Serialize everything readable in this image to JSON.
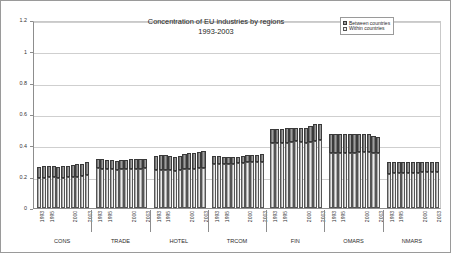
{
  "chart_data": {
    "type": "bar",
    "subtype": "stacked",
    "title": "Concentration of EU industries by regions",
    "subtitle": "1993-2003",
    "xlabel": "",
    "ylabel": "",
    "ylim": [
      0,
      1.2
    ],
    "ytick_labels": [
      "0",
      "0.2",
      "0.4",
      "0.6",
      "0.8",
      "1",
      "1.2"
    ],
    "ytick_values": [
      0,
      0.2,
      0.4,
      0.6,
      0.8,
      1,
      1.2
    ],
    "grid": true,
    "legend_position": "top-right",
    "legend": [
      "Between countries",
      "Within countries"
    ],
    "x": [
      "1993",
      "1994",
      "1995",
      "1996",
      "1997",
      "1998",
      "1999",
      "2000",
      "2001",
      "2002",
      "2003"
    ],
    "x_tick_labels_shown": [
      "1993",
      "1995",
      "2000",
      "2003"
    ],
    "groups": [
      {
        "name": "CONS",
        "years": [
          "1993",
          "1994",
          "1995",
          "1996",
          "1997",
          "1998",
          "1999",
          "2000",
          "2001",
          "2002",
          "2003"
        ],
        "within": [
          0.192,
          0.193,
          0.195,
          0.196,
          0.192,
          0.193,
          0.196,
          0.198,
          0.2,
          0.203,
          0.208
        ],
        "between": [
          0.073,
          0.075,
          0.073,
          0.074,
          0.07,
          0.073,
          0.075,
          0.077,
          0.079,
          0.08,
          0.083
        ],
        "total": [
          0.265,
          0.268,
          0.268,
          0.27,
          0.262,
          0.266,
          0.271,
          0.275,
          0.279,
          0.283,
          0.291
        ]
      },
      {
        "name": "TRADE",
        "years": [
          "1993",
          "1994",
          "1995",
          "1996",
          "1997",
          "1998",
          "1999",
          "2000",
          "2001",
          "2002",
          "2003"
        ],
        "within": [
          0.253,
          0.25,
          0.247,
          0.246,
          0.245,
          0.246,
          0.249,
          0.251,
          0.252,
          0.252,
          0.253
        ],
        "between": [
          0.06,
          0.06,
          0.059,
          0.058,
          0.057,
          0.058,
          0.059,
          0.061,
          0.061,
          0.062,
          0.062
        ],
        "total": [
          0.313,
          0.31,
          0.306,
          0.304,
          0.302,
          0.304,
          0.308,
          0.312,
          0.313,
          0.314,
          0.315
        ]
      },
      {
        "name": "HOTEL",
        "years": [
          "1993",
          "1994",
          "1995",
          "1996",
          "1997",
          "1998",
          "1999",
          "2000",
          "2001",
          "2002",
          "2003"
        ],
        "within": [
          0.243,
          0.244,
          0.243,
          0.242,
          0.238,
          0.243,
          0.248,
          0.251,
          0.251,
          0.253,
          0.256
        ],
        "between": [
          0.092,
          0.093,
          0.093,
          0.09,
          0.087,
          0.09,
          0.095,
          0.1,
          0.103,
          0.105,
          0.108
        ],
        "total": [
          0.335,
          0.337,
          0.336,
          0.332,
          0.325,
          0.333,
          0.343,
          0.351,
          0.354,
          0.358,
          0.364
        ]
      },
      {
        "name": "TRCOM",
        "years": [
          "1993",
          "1994",
          "1995",
          "1996",
          "1997",
          "1998",
          "1999",
          "2000",
          "2001",
          "2002",
          "2003"
        ],
        "within": [
          0.281,
          0.282,
          0.281,
          0.28,
          0.281,
          0.286,
          0.29,
          0.292,
          0.292,
          0.292,
          0.295
        ],
        "between": [
          0.049,
          0.048,
          0.046,
          0.043,
          0.042,
          0.042,
          0.044,
          0.045,
          0.046,
          0.048,
          0.05
        ],
        "total": [
          0.33,
          0.33,
          0.327,
          0.323,
          0.323,
          0.328,
          0.334,
          0.337,
          0.338,
          0.34,
          0.345
        ]
      },
      {
        "name": "FIN",
        "years": [
          "1993",
          "1994",
          "1995",
          "1996",
          "1997",
          "1998",
          "1999",
          "2000",
          "2001",
          "2002",
          "2003"
        ],
        "within": [
          0.417,
          0.416,
          0.416,
          0.418,
          0.422,
          0.426,
          0.42,
          0.415,
          0.421,
          0.428,
          0.431
        ],
        "between": [
          0.086,
          0.088,
          0.09,
          0.092,
          0.09,
          0.087,
          0.089,
          0.096,
          0.105,
          0.109,
          0.104
        ],
        "total": [
          0.503,
          0.504,
          0.506,
          0.51,
          0.512,
          0.513,
          0.509,
          0.511,
          0.526,
          0.537,
          0.535
        ]
      },
      {
        "name": "OMARS",
        "years": [
          "1993",
          "1994",
          "1995",
          "1996",
          "1997",
          "1998",
          "1999",
          "2000",
          "2001",
          "2002",
          "2003"
        ],
        "within": [
          0.352,
          0.352,
          0.35,
          0.348,
          0.35,
          0.352,
          0.355,
          0.357,
          0.355,
          0.352,
          0.348
        ],
        "between": [
          0.12,
          0.12,
          0.121,
          0.122,
          0.12,
          0.119,
          0.117,
          0.116,
          0.115,
          0.11,
          0.104
        ],
        "total": [
          0.472,
          0.472,
          0.471,
          0.47,
          0.47,
          0.471,
          0.472,
          0.473,
          0.47,
          0.462,
          0.452
        ]
      },
      {
        "name": "NMARS",
        "years": [
          "1993",
          "1994",
          "1995",
          "1996",
          "1997",
          "1998",
          "1999",
          "2000",
          "2001",
          "2002",
          "2003"
        ],
        "within": [
          0.219,
          0.222,
          0.223,
          0.224,
          0.224,
          0.225,
          0.226,
          0.227,
          0.227,
          0.228,
          0.228
        ],
        "between": [
          0.072,
          0.071,
          0.07,
          0.07,
          0.07,
          0.07,
          0.07,
          0.069,
          0.069,
          0.068,
          0.068
        ],
        "total": [
          0.291,
          0.293,
          0.293,
          0.294,
          0.294,
          0.295,
          0.296,
          0.296,
          0.296,
          0.296,
          0.296
        ]
      }
    ]
  },
  "colors": {
    "between": "#9d9d9d",
    "within": "#ebebeb",
    "grid": "#cfcfcf",
    "axis": "#8d8d8d",
    "text": "#2b2b2b",
    "frame": "#9a9a9a"
  }
}
